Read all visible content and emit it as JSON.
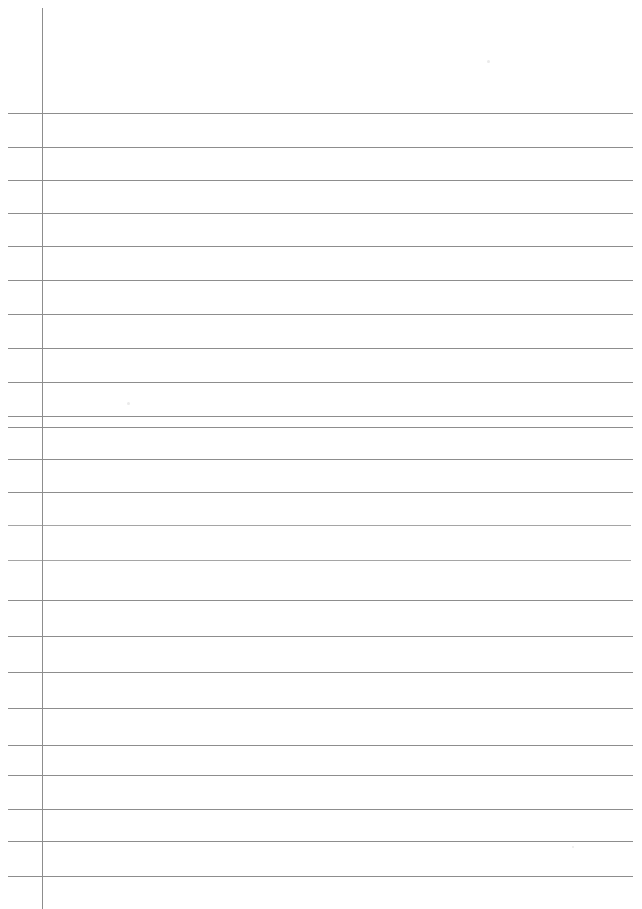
{
  "document": {
    "kind": "scanned-lined-paper",
    "title": "Blank ruled notebook page",
    "page_width": 642,
    "page_height": 909,
    "background_color": "#ffffff",
    "rule_color": "#8d8d8d",
    "faint_rule_color": "#a5a5a5",
    "margin_rule_color": "#8d8d8d",
    "content_text": "",
    "visible_text_count": 0
  },
  "margin_rule": {
    "name": "vertical-margin-line",
    "x": 42,
    "y_start": 8,
    "y_end": 909,
    "thickness": 1,
    "color": "#8d8d8d"
  },
  "ruled_lines": {
    "count": 23,
    "x_start": 8,
    "x_end": 633,
    "thickness": 1,
    "items": [
      {
        "index": 1,
        "y": 113,
        "x_start": 8,
        "x_end": 633,
        "faint": false
      },
      {
        "index": 2,
        "y": 147,
        "x_start": 8,
        "x_end": 633,
        "faint": false
      },
      {
        "index": 3,
        "y": 180,
        "x_start": 8,
        "x_end": 633,
        "faint": false
      },
      {
        "index": 4,
        "y": 213,
        "x_start": 8,
        "x_end": 633,
        "faint": false
      },
      {
        "index": 5,
        "y": 246,
        "x_start": 8,
        "x_end": 633,
        "faint": false
      },
      {
        "index": 6,
        "y": 280,
        "x_start": 8,
        "x_end": 633,
        "faint": false
      },
      {
        "index": 7,
        "y": 314,
        "x_start": 8,
        "x_end": 633,
        "faint": false
      },
      {
        "index": 8,
        "y": 348,
        "x_start": 8,
        "x_end": 633,
        "faint": false
      },
      {
        "index": 9,
        "y": 382,
        "x_start": 8,
        "x_end": 633,
        "faint": false
      },
      {
        "index": 10,
        "y": 416,
        "x_start": 8,
        "x_end": 633,
        "faint": false
      },
      {
        "index": 11,
        "y": 427,
        "x_start": 8,
        "x_end": 633,
        "faint": false
      },
      {
        "index": 12,
        "y": 459,
        "x_start": 8,
        "x_end": 633,
        "faint": false
      },
      {
        "index": 13,
        "y": 492,
        "x_start": 8,
        "x_end": 633,
        "faint": false
      },
      {
        "index": 14,
        "y": 525,
        "x_start": 8,
        "x_end": 631,
        "faint": true
      },
      {
        "index": 15,
        "y": 560,
        "x_start": 8,
        "x_end": 631,
        "faint": true
      },
      {
        "index": 16,
        "y": 600,
        "x_start": 8,
        "x_end": 633,
        "faint": false
      },
      {
        "index": 17,
        "y": 636,
        "x_start": 8,
        "x_end": 633,
        "faint": false
      },
      {
        "index": 18,
        "y": 672,
        "x_start": 8,
        "x_end": 633,
        "faint": false
      },
      {
        "index": 19,
        "y": 708,
        "x_start": 8,
        "x_end": 633,
        "faint": false
      },
      {
        "index": 20,
        "y": 745,
        "x_start": 8,
        "x_end": 633,
        "faint": false
      },
      {
        "index": 21,
        "y": 775,
        "x_start": 8,
        "x_end": 633,
        "faint": false
      },
      {
        "index": 22,
        "y": 809,
        "x_start": 8,
        "x_end": 633,
        "faint": false
      },
      {
        "index": 23,
        "y": 841,
        "x_start": 8,
        "x_end": 633,
        "faint": false
      },
      {
        "index": 24,
        "y": 876,
        "x_start": 8,
        "x_end": 633,
        "faint": false
      }
    ]
  },
  "scan_artifacts": {
    "name": "scan-specks",
    "items": [
      {
        "x": 487,
        "y": 60,
        "size": 3
      },
      {
        "x": 127,
        "y": 402,
        "size": 3
      },
      {
        "x": 572,
        "y": 846,
        "size": 2
      }
    ]
  }
}
